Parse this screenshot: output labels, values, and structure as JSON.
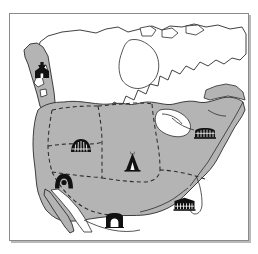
{
  "figure": {
    "frame": {
      "width": 240,
      "height": 228,
      "border_color": "#8a8a8a",
      "shadow_color": "#b9b9b9"
    },
    "colors": {
      "land_shaded": "#b4b4b4",
      "land_unshaded": "#ffffff",
      "ocean": "#ffffff",
      "coastline": "#2b2b2b",
      "boundary_dashed": "#2b2b2b",
      "icon_fill": "#111111",
      "page_background": "#ffffff"
    },
    "legend_present": false,
    "labels_present": false
  },
  "markers": [
    {
      "id": "northwest-coast",
      "icon": "plank-house-icon",
      "icon_description": "Northwest Coast plank house with totem pole",
      "x": 23,
      "y": 48,
      "width": 18,
      "height": 17
    },
    {
      "id": "plateau-great-basin",
      "icon": "earth-lodge-icon",
      "icon_description": "Domed earth lodge dwelling",
      "x": 60,
      "y": 124,
      "width": 22,
      "height": 15
    },
    {
      "id": "southwest-hogan",
      "icon": "hogan-arch-icon",
      "icon_description": "Arched hogan dwelling with round doorway",
      "x": 44,
      "y": 159,
      "width": 20,
      "height": 16
    },
    {
      "id": "great-plains",
      "icon": "teepee-icon",
      "icon_description": "Plains teepee / tipi",
      "x": 114,
      "y": 136,
      "width": 17,
      "height": 22
    },
    {
      "id": "northeast-woodlands",
      "icon": "longhouse-icon",
      "icon_description": "Iroquois longhouse with vertical posts",
      "x": 184,
      "y": 113,
      "width": 22,
      "height": 12
    },
    {
      "id": "southeast-woodlands",
      "icon": "village-house-icon",
      "icon_description": "Southeast village house with vertical posts",
      "x": 163,
      "y": 183,
      "width": 23,
      "height": 14
    },
    {
      "id": "mesoamerica-north",
      "icon": "adobe-house-icon",
      "icon_description": "Adobe house with arched doorway",
      "x": 95,
      "y": 198,
      "width": 19,
      "height": 16
    }
  ],
  "geography": {
    "shaded_region_note": "Contiguous United States plus adjacent southern Canada, Pacific Northwest coast and northern Mexico are shaded gray.",
    "unshaded_region_note": "Northern and central Canada, Arctic islands, Hudson Bay, Gulf of California and the oceans are left white.",
    "water_bodies": [
      "Hudson Bay",
      "Great Lakes",
      "Gulf of California",
      "Gulf of Mexico",
      "Pacific Ocean",
      "Atlantic Ocean"
    ],
    "internal_boundaries": "Dashed lines subdivide the shaded region into seven culture areas."
  }
}
